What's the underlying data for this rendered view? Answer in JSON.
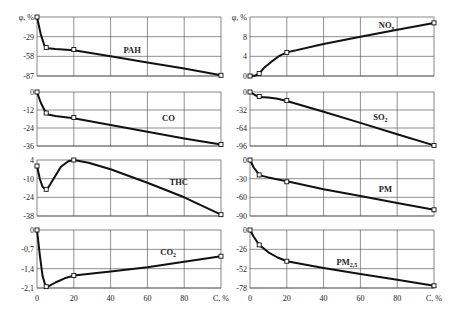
{
  "chart_data": [
    {
      "type": "line",
      "title": "PAH",
      "xlabel": "C, %",
      "ylabel": "φ, %",
      "xlim": [
        0,
        100
      ],
      "ylim": [
        -87,
        0
      ],
      "yticks": [
        "φ, %",
        "-29",
        "-58",
        "-87"
      ],
      "grid": true,
      "x": [
        0,
        5,
        20,
        100
      ],
      "values": [
        0,
        -45,
        -48,
        -86
      ],
      "curve": [
        [
          0,
          0
        ],
        [
          2,
          -25
        ],
        [
          4,
          -42
        ],
        [
          6,
          -46
        ],
        [
          10,
          -47
        ],
        [
          20,
          -49
        ],
        [
          40,
          -58
        ],
        [
          60,
          -67
        ],
        [
          80,
          -76
        ],
        [
          100,
          -86
        ]
      ],
      "label_pos": [
        47,
        -53
      ]
    },
    {
      "type": "line",
      "title": "NOx",
      "title_sub": "x",
      "xlabel": "C, %",
      "ylabel": "φ, %",
      "xlim": [
        0,
        100
      ],
      "ylim": [
        0,
        12
      ],
      "yticks": [
        "φ, %",
        "8",
        "4",
        "0"
      ],
      "grid": true,
      "x": [
        0,
        5,
        20,
        100
      ],
      "values": [
        0,
        0.5,
        4.8,
        10.8
      ],
      "curve": [
        [
          0,
          0
        ],
        [
          3,
          0.1
        ],
        [
          5,
          0.5
        ],
        [
          8,
          1.8
        ],
        [
          12,
          3
        ],
        [
          16,
          4.1
        ],
        [
          20,
          4.8
        ],
        [
          40,
          6.5
        ],
        [
          60,
          8
        ],
        [
          80,
          9.4
        ],
        [
          100,
          10.8
        ]
      ],
      "label_pos": [
        70,
        9.8
      ]
    },
    {
      "type": "line",
      "title": "CO",
      "xlabel": "C, %",
      "ylabel": "φ, %",
      "xlim": [
        0,
        100
      ],
      "ylim": [
        -36,
        0
      ],
      "yticks": [
        "0",
        "-12",
        "-24",
        "-36"
      ],
      "grid": true,
      "x": [
        0,
        5,
        20,
        100
      ],
      "values": [
        0,
        -14,
        -17,
        -35
      ],
      "curve": [
        [
          0,
          0
        ],
        [
          2,
          -7
        ],
        [
          4,
          -12
        ],
        [
          6,
          -15
        ],
        [
          10,
          -16
        ],
        [
          20,
          -17.5
        ],
        [
          40,
          -22
        ],
        [
          60,
          -26.5
        ],
        [
          80,
          -31
        ],
        [
          100,
          -35
        ]
      ],
      "label_pos": [
        68,
        -19
      ]
    },
    {
      "type": "line",
      "title": "SO2",
      "title_sub": "2",
      "xlabel": "C, %",
      "ylabel": "φ, %",
      "xlim": [
        0,
        100
      ],
      "ylim": [
        -96,
        0
      ],
      "yticks": [
        "0",
        "-32",
        "-64",
        "-96"
      ],
      "grid": true,
      "x": [
        0,
        5,
        20,
        100
      ],
      "values": [
        0,
        -8,
        -15,
        -95
      ],
      "curve": [
        [
          0,
          0
        ],
        [
          3,
          -6
        ],
        [
          5,
          -9
        ],
        [
          10,
          -10
        ],
        [
          15,
          -12
        ],
        [
          20,
          -16
        ],
        [
          40,
          -35
        ],
        [
          60,
          -55
        ],
        [
          80,
          -75
        ],
        [
          100,
          -95
        ]
      ],
      "label_pos": [
        67,
        -50
      ]
    },
    {
      "type": "line",
      "title": "THC",
      "xlabel": "C, %",
      "ylabel": "φ, %",
      "xlim": [
        0,
        100
      ],
      "ylim": [
        -38,
        4
      ],
      "yticks": [
        "4",
        "-10",
        "-24",
        "-38"
      ],
      "grid": true,
      "x": [
        0,
        5,
        20,
        100
      ],
      "values": [
        -0.5,
        -18,
        4,
        -37
      ],
      "curve": [
        [
          0,
          -0.5
        ],
        [
          1.5,
          -10
        ],
        [
          3,
          -16
        ],
        [
          4.5,
          -18
        ],
        [
          6,
          -17
        ],
        [
          9,
          -10
        ],
        [
          13,
          -1
        ],
        [
          17,
          3
        ],
        [
          20,
          4
        ],
        [
          28,
          2
        ],
        [
          40,
          -3
        ],
        [
          60,
          -13
        ],
        [
          80,
          -24
        ],
        [
          100,
          -37
        ]
      ],
      "label_pos": [
        72,
        -15
      ]
    },
    {
      "type": "line",
      "title": "PM",
      "xlabel": "C, %",
      "ylabel": "φ, %",
      "xlim": [
        0,
        100
      ],
      "ylim": [
        -90,
        0
      ],
      "yticks": [
        "0",
        "-30",
        "-60",
        "-90"
      ],
      "grid": true,
      "x": [
        0,
        5,
        20,
        100
      ],
      "values": [
        0,
        -24,
        -35,
        -80
      ],
      "curve": [
        [
          0,
          0
        ],
        [
          2,
          -12
        ],
        [
          4,
          -20
        ],
        [
          6,
          -25
        ],
        [
          10,
          -28
        ],
        [
          20,
          -34
        ],
        [
          40,
          -47
        ],
        [
          60,
          -58
        ],
        [
          80,
          -69
        ],
        [
          100,
          -80
        ]
      ],
      "label_pos": [
        70,
        -52
      ]
    },
    {
      "type": "line",
      "title": "CO2",
      "title_sub": "2",
      "xlabel": "C, %",
      "ylabel": "φ, %",
      "xlim": [
        0,
        100
      ],
      "ylim": [
        -2.1,
        0
      ],
      "yticks": [
        "0",
        "-0,7",
        "-1,4",
        "-2,1"
      ],
      "grid": true,
      "x": [
        0,
        5,
        20,
        100
      ],
      "values": [
        0,
        -2.05,
        -1.65,
        -0.95
      ],
      "curve": [
        [
          0,
          0
        ],
        [
          1.5,
          -0.9
        ],
        [
          3,
          -1.65
        ],
        [
          4.5,
          -2
        ],
        [
          6,
          -2.05
        ],
        [
          10,
          -1.9
        ],
        [
          15,
          -1.75
        ],
        [
          20,
          -1.65
        ],
        [
          40,
          -1.5
        ],
        [
          60,
          -1.35
        ],
        [
          80,
          -1.15
        ],
        [
          100,
          -0.95
        ]
      ],
      "label_pos": [
        67,
        -0.9
      ]
    },
    {
      "type": "line",
      "title": "PM2,5",
      "title_sub": "2,5",
      "xlabel": "C, %",
      "ylabel": "φ, %",
      "xlim": [
        0,
        100
      ],
      "ylim": [
        -78,
        0
      ],
      "yticks": [
        "0",
        "-26",
        "-52",
        "-78"
      ],
      "grid": true,
      "x": [
        0,
        5,
        20,
        100
      ],
      "values": [
        0,
        -20,
        -42,
        -75
      ],
      "curve": [
        [
          0,
          0
        ],
        [
          2,
          -9
        ],
        [
          5,
          -20
        ],
        [
          10,
          -30
        ],
        [
          15,
          -37
        ],
        [
          20,
          -42
        ],
        [
          40,
          -51
        ],
        [
          60,
          -59
        ],
        [
          80,
          -67
        ],
        [
          100,
          -75
        ]
      ],
      "label_pos": [
        47,
        -47
      ]
    }
  ],
  "axis": {
    "x_ticks": [
      "0",
      "20",
      "40",
      "60",
      "80",
      "C, %"
    ],
    "x_label": "C, %",
    "y_label": "φ, %"
  },
  "panels": [
    {
      "id": "pah",
      "label": "PAH",
      "sub": ""
    },
    {
      "id": "nox",
      "label": "NO",
      "sub": "x"
    },
    {
      "id": "co",
      "label": "CO",
      "sub": ""
    },
    {
      "id": "so2",
      "label": "SO",
      "sub": "2"
    },
    {
      "id": "thc",
      "label": "THC",
      "sub": ""
    },
    {
      "id": "pm",
      "label": "PM",
      "sub": ""
    },
    {
      "id": "co2",
      "label": "CO",
      "sub": "2"
    },
    {
      "id": "pm25",
      "label": "PM",
      "sub": "2,5"
    }
  ]
}
